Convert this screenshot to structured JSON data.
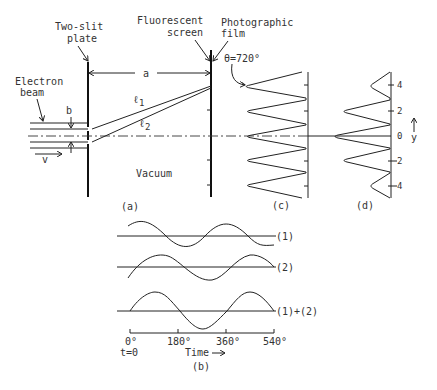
{
  "panel_a": {
    "two_slit_label_1": "Two-slit",
    "two_slit_label_2": "plate",
    "screen_label_1": "Fluorescent",
    "screen_label_2": "screen",
    "film_label_1": "Photographic",
    "film_label_2": "film",
    "distance_label": "a",
    "electron_label_1": "Electron",
    "electron_label_2": "beam",
    "slit_sep_label": "b",
    "velocity_label": "v",
    "path1_label": "ℓ",
    "path1_sub": "1",
    "path2_label": "ℓ",
    "path2_sub": "2",
    "vacuum_label": "Vacuum",
    "caption": "(a)"
  },
  "panel_c": {
    "theta_label": "θ=720°",
    "caption": "(c)"
  },
  "panel_d": {
    "ticks": [
      "4",
      "2",
      "0",
      "2",
      "4"
    ],
    "axis_label": "y",
    "caption": "(d)"
  },
  "panel_b": {
    "wave1_label": "(1)",
    "wave2_label": "(2)",
    "sum_label": "(1)+(2)",
    "time_ticks": [
      "0°",
      "180°",
      "360°",
      "540°"
    ],
    "t0_label": "t=0",
    "time_label": "Time",
    "caption": "(b)"
  }
}
